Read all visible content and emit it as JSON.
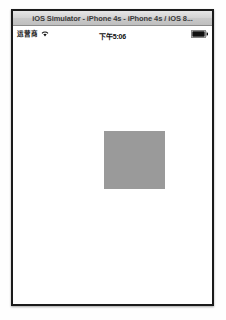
{
  "window": {
    "title": "iOS Simulator - iPhone 4s - iPhone 4s / iOS 8...",
    "frame_color": "#1b1b1b",
    "titlebar_color": "#d4d4d4"
  },
  "status_bar": {
    "carrier": "运营商",
    "wifi_icon": "wifi-icon",
    "time": "下午5:06",
    "battery_icon": "battery-full-icon",
    "battery_level_percent": 100,
    "text_color": "#111111",
    "background": "#ffffff"
  },
  "content": {
    "background": "#ffffff",
    "shapes": [
      {
        "name": "gray-square",
        "type": "rect",
        "color": "#9a9a9a",
        "x": 91,
        "y": 90,
        "width": 61,
        "height": 58
      }
    ]
  }
}
